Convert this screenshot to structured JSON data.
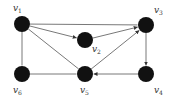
{
  "diagram": {
    "type": "directed-graph",
    "node_color": "#111111",
    "edge_color": "#555555",
    "nodes": [
      {
        "id": "v1",
        "label": "v",
        "sub": "1",
        "x": 22,
        "y": 24,
        "lx": 13,
        "ly": 11
      },
      {
        "id": "v2",
        "label": "v",
        "sub": "2",
        "x": 85,
        "y": 40,
        "lx": 92,
        "ly": 52
      },
      {
        "id": "v3",
        "label": "v",
        "sub": "3",
        "x": 146,
        "y": 25,
        "lx": 154,
        "ly": 13
      },
      {
        "id": "v4",
        "label": "v",
        "sub": "4",
        "x": 146,
        "y": 74,
        "lx": 154,
        "ly": 93
      },
      {
        "id": "v5",
        "label": "v",
        "sub": "5",
        "x": 85,
        "y": 74,
        "lx": 80,
        "ly": 93
      },
      {
        "id": "v6",
        "label": "v",
        "sub": "6",
        "x": 22,
        "y": 74,
        "lx": 13,
        "ly": 93
      }
    ],
    "edges": [
      {
        "from": "v1",
        "to": "v3",
        "directed": false
      },
      {
        "from": "v1",
        "to": "v2",
        "directed": true
      },
      {
        "from": "v2",
        "to": "v3",
        "directed": true
      },
      {
        "from": "v1",
        "to": "v5",
        "directed": false
      },
      {
        "from": "v1",
        "to": "v6",
        "directed": false
      },
      {
        "from": "v6",
        "to": "v5",
        "directed": false
      },
      {
        "from": "v5",
        "to": "v3",
        "directed": true
      },
      {
        "from": "v3",
        "to": "v4",
        "directed": true
      },
      {
        "from": "v4",
        "to": "v5",
        "directed": true
      }
    ]
  }
}
